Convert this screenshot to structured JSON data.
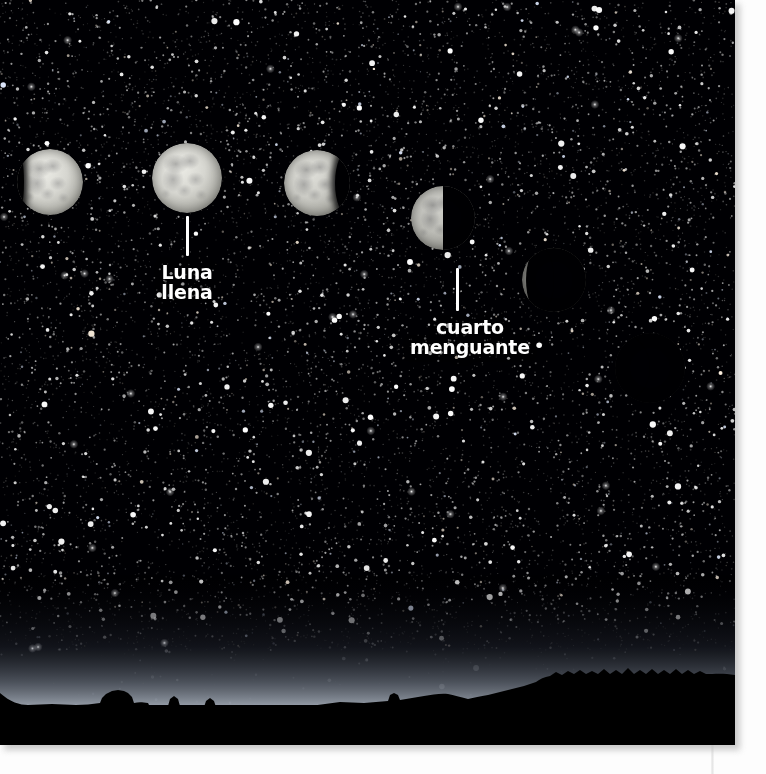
{
  "page": {
    "background_color": "#ffffff",
    "gutter_line_color": "#e2e2e2"
  },
  "photo": {
    "alt": "moon-phases-night-sky-photograph",
    "sky_color": "#000003",
    "horizon_glow_color": "#96a0af",
    "landscape_color": "#000000"
  },
  "moons": [
    {
      "name": "moon-waxing-gibbous-1",
      "phase": "gibbous",
      "cx": 50,
      "cy": 182,
      "r": 33,
      "lit": 0.9,
      "shadow_side": "left",
      "brightness": 1.0
    },
    {
      "name": "moon-full",
      "phase": "full",
      "cx": 187,
      "cy": 178,
      "r": 35,
      "lit": 1.0,
      "shadow_side": "none",
      "brightness": 1.0
    },
    {
      "name": "moon-waning-gibbous",
      "phase": "waning-gibbous",
      "cx": 317,
      "cy": 183,
      "r": 33,
      "lit": 0.78,
      "shadow_side": "right",
      "brightness": 0.95
    },
    {
      "name": "moon-last-quarter",
      "phase": "last-quarter",
      "cx": 443,
      "cy": 218,
      "r": 32,
      "lit": 0.5,
      "shadow_side": "right",
      "brightness": 0.88
    },
    {
      "name": "moon-waning-crescent",
      "phase": "waning-crescent",
      "cx": 554,
      "cy": 280,
      "r": 32,
      "lit": 0.28,
      "shadow_side": "right",
      "brightness": 0.62
    },
    {
      "name": "moon-new",
      "phase": "new",
      "cx": 650,
      "cy": 368,
      "r": 35,
      "lit": 0.03,
      "shadow_side": "right",
      "brightness": 0.18
    }
  ],
  "annotations": [
    {
      "name": "luna-llena",
      "line1": "Luna",
      "line2": "llena",
      "leader": {
        "x": 187,
        "y_top": 216,
        "y_bottom": 256
      },
      "text_x": 187,
      "text_y": 262,
      "color": "#ffffff"
    },
    {
      "name": "cuarto-menguante",
      "line1": "cuarto",
      "line2": "menguante",
      "leader": {
        "x": 457,
        "y_top": 268,
        "y_bottom": 311
      },
      "text_x": 470,
      "text_y": 317,
      "color": "#ffffff"
    }
  ]
}
